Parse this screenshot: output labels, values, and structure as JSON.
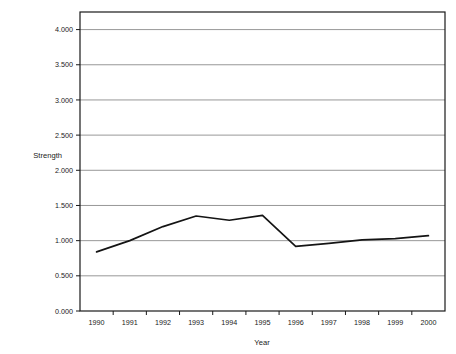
{
  "chart_data": {
    "type": "line",
    "title": "",
    "subtitle": "",
    "xlabel": "Year",
    "ylabel": "Strength",
    "categories": [
      "1990",
      "1991",
      "1992",
      "1993",
      "1994",
      "1995",
      "1996",
      "1997",
      "1998",
      "1999",
      "2000"
    ],
    "values": [
      0.84,
      1.0,
      1.2,
      1.35,
      1.29,
      1.36,
      0.92,
      0.96,
      1.01,
      1.03,
      1.07
    ],
    "series": [
      {
        "name": "Strength",
        "values": [
          0.84,
          1.0,
          1.2,
          1.35,
          1.29,
          1.36,
          0.92,
          0.96,
          1.01,
          1.03,
          1.07
        ]
      }
    ],
    "ylim": [
      0,
      4.25
    ],
    "yticks": [
      0,
      0.5,
      1.0,
      1.5,
      2.0,
      2.5,
      3.0,
      3.5,
      4.0
    ],
    "ytick_labels": [
      "0.000",
      "0.500",
      "1.000",
      "1.500",
      "2.000",
      "2.500",
      "3.000",
      "3.500",
      "4.000"
    ],
    "xtick_labels": [
      "1990",
      "1991",
      "1992",
      "1993",
      "1994",
      "1995",
      "1996",
      "1997",
      "1998",
      "1999",
      "2000"
    ],
    "grid": "horizontal",
    "legend": "none",
    "annotations": [],
    "colors": {
      "line": "#141414",
      "grid": "#8c8c8c",
      "frame": "#1a1a1a",
      "background": "#ffffff",
      "text": "#1a1a1a"
    }
  }
}
